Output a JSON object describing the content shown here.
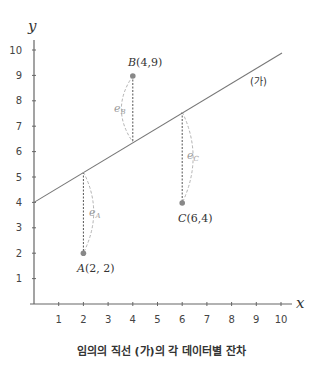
{
  "chart_data": {
    "type": "scatter",
    "title": "임의의 직선 (가)의 각 데이터별 잔차",
    "xlabel": "x",
    "ylabel": "y",
    "xlim": [
      0,
      10
    ],
    "ylim": [
      0,
      10
    ],
    "x_ticks": [
      1,
      2,
      3,
      4,
      5,
      6,
      7,
      8,
      9,
      10
    ],
    "y_ticks": [
      1,
      2,
      3,
      4,
      5,
      6,
      7,
      8,
      9,
      10
    ],
    "grid": false,
    "points": [
      {
        "name": "A",
        "x": 2,
        "y": 2,
        "label": "A(2, 2)",
        "residual_label": "e_A",
        "line_y": 5.2
      },
      {
        "name": "B",
        "x": 4,
        "y": 9,
        "label": "B(4,9)",
        "residual_label": "e_B",
        "line_y": 6.4
      },
      {
        "name": "C",
        "x": 6,
        "y": 4,
        "label": "C(6,4)",
        "residual_label": "e_C",
        "line_y": 7.6
      }
    ],
    "line": {
      "name": "(가)",
      "intercept": 4,
      "slope": 0.6,
      "x_range": [
        0,
        10
      ]
    },
    "colors": {
      "axis": "#666666",
      "line": "#777777",
      "point": "#888888",
      "residual": "#555555",
      "residual_arc": "#aaaaaa"
    }
  },
  "labels": {
    "y_axis": "y",
    "x_axis": "x",
    "line_name": "(가)",
    "point_a_name": "A",
    "point_a_coords": "(2, 2)",
    "point_b_name": "B",
    "point_b_coords": "(4,9)",
    "point_c_name": "C",
    "point_c_coords": "(6,4)",
    "e": "e",
    "sub_a": "A",
    "sub_b": "B",
    "sub_c": "C",
    "x_ticks": [
      "1",
      "2",
      "3",
      "4",
      "5",
      "6",
      "7",
      "8",
      "9",
      "10"
    ],
    "y_ticks": [
      "1",
      "2",
      "3",
      "4",
      "5",
      "6",
      "7",
      "8",
      "9",
      "10"
    ]
  },
  "caption": "임의의 직선 (가)의 각 데이터별 잔차"
}
